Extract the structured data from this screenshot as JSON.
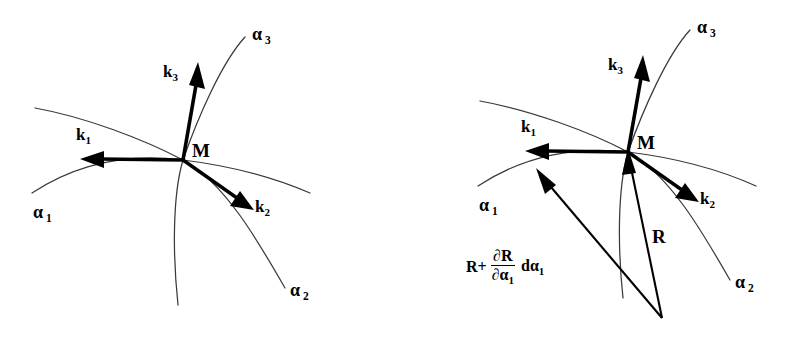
{
  "figure": {
    "background_color": "#ffffff",
    "curve_color": "#3a3a3a",
    "vector_color": "#000000",
    "panels": [
      {
        "id": "left",
        "name": "basis-vectors-panel",
        "origin_label": "M",
        "coordinate_curves": [
          {
            "name": "alpha-1-curve",
            "label": "α",
            "subscript": "1"
          },
          {
            "name": "alpha-2-curve",
            "label": "α",
            "subscript": "2"
          },
          {
            "name": "alpha-3-curve",
            "label": "α",
            "subscript": "3"
          }
        ],
        "basis_vectors": [
          {
            "name": "k1-vector",
            "label": "k",
            "subscript": "1",
            "direction": "left"
          },
          {
            "name": "k2-vector",
            "label": "k",
            "subscript": "2",
            "direction": "down-right"
          },
          {
            "name": "k3-vector",
            "label": "k",
            "subscript": "3",
            "direction": "up"
          }
        ]
      },
      {
        "id": "right",
        "name": "position-vectors-panel",
        "origin_label": "M",
        "coordinate_curves": [
          {
            "name": "alpha-1-curve",
            "label": "α",
            "subscript": "1"
          },
          {
            "name": "alpha-2-curve",
            "label": "α",
            "subscript": "2"
          },
          {
            "name": "alpha-3-curve",
            "label": "α",
            "subscript": "3"
          }
        ],
        "basis_vectors": [
          {
            "name": "k1-vector",
            "label": "k",
            "subscript": "1",
            "direction": "left"
          },
          {
            "name": "k2-vector",
            "label": "k",
            "subscript": "2",
            "direction": "down-right"
          },
          {
            "name": "k3-vector",
            "label": "k",
            "subscript": "3",
            "direction": "up"
          }
        ],
        "position_vectors": [
          {
            "name": "R-vector",
            "label": "R",
            "description": "position vector to M"
          },
          {
            "name": "R-plus-dR-vector",
            "description": "position vector to neighbouring point on alpha-1 curve",
            "formula": {
              "lead": "R+",
              "numerator": "∂R",
              "denominator": "∂α",
              "denominator_sub": "1",
              "tail": "dα",
              "tail_sub": "1"
            }
          }
        ]
      }
    ]
  },
  "labels": {
    "alpha": "α",
    "k": "k",
    "M": "M",
    "R": "R",
    "sub1": "1",
    "sub2": "2",
    "sub3": "3"
  }
}
